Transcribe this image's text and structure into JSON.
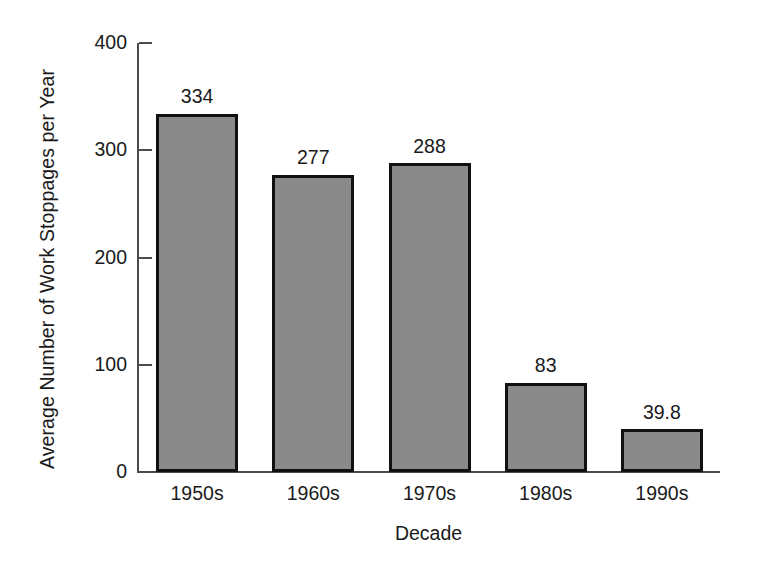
{
  "chart_data": {
    "type": "bar",
    "title": "",
    "subtitle": "",
    "xlabel": "Decade",
    "ylabel": "Average Number of Work Stoppages per Year",
    "categories": [
      "1950s",
      "1960s",
      "1970s",
      "1980s",
      "1990s"
    ],
    "values": [
      334,
      277,
      288,
      83,
      39.8
    ],
    "value_labels": [
      "334",
      "277",
      "288",
      "83",
      "39.8"
    ],
    "ylim": [
      0,
      400
    ],
    "yticks": [
      0,
      100,
      200,
      300,
      400
    ],
    "ytick_labels": [
      "0",
      "100",
      "200",
      "300",
      "400"
    ],
    "grid": false,
    "legend": null,
    "legend_position": "none",
    "bar_fill_color": "#8a8a8a",
    "bar_edge_color": "#111111",
    "axis_color": "#4a4a4a",
    "background_color": "#ffffff",
    "annotations": []
  }
}
